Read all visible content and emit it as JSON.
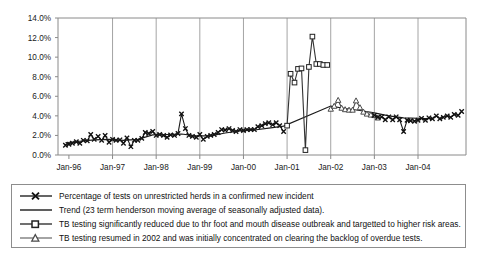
{
  "chart_data": {
    "type": "line",
    "title": "",
    "xlabel": "",
    "ylabel": "",
    "ylim": [
      0,
      14
    ],
    "ytick_labels": [
      "0.0%",
      "2.0%",
      "4.0%",
      "6.0%",
      "8.0%",
      "10.0%",
      "12.0%",
      "14.0%"
    ],
    "ytick_values": [
      0,
      2,
      4,
      6,
      8,
      10,
      12,
      14
    ],
    "xtick_labels": [
      "Jan-96",
      "Jan-97",
      "Jan-98",
      "Jan-99",
      "Jan-00",
      "Jan-01",
      "Jan-02",
      "Jan-03",
      "Jan-04"
    ],
    "xtick_values": [
      1996.0,
      1997.0,
      1998.0,
      1999.0,
      2000.0,
      2001.0,
      2002.0,
      2003.0,
      2004.0
    ],
    "xlim": [
      1995.75,
      2005.1
    ],
    "grid": "vertical only",
    "legend_position": "below-plot",
    "series": [
      {
        "name": "Percentage of tests on unrestricted herds in a confirmed new incident",
        "marker": "x",
        "x": [
          1995.92,
          1996.0,
          1996.08,
          1996.17,
          1996.25,
          1996.33,
          1996.42,
          1996.5,
          1996.58,
          1996.67,
          1996.75,
          1996.83,
          1996.92,
          1997.0,
          1997.08,
          1997.17,
          1997.25,
          1997.33,
          1997.42,
          1997.5,
          1997.58,
          1997.67,
          1997.75,
          1997.83,
          1997.92,
          1998.0,
          1998.08,
          1998.17,
          1998.25,
          1998.33,
          1998.42,
          1998.5,
          1998.58,
          1998.67,
          1998.75,
          1998.83,
          1998.92,
          1999.0,
          1999.08,
          1999.17,
          1999.25,
          1999.33,
          1999.42,
          1999.5,
          1999.58,
          1999.67,
          1999.75,
          1999.83,
          1999.92,
          2000.0,
          2000.08,
          2000.17,
          2000.25,
          2000.33,
          2000.42,
          2000.5,
          2000.58,
          2000.67,
          2000.75,
          2000.83,
          2000.92
        ],
        "values": [
          1.0,
          1.1,
          1.2,
          1.35,
          1.2,
          1.5,
          1.45,
          2.1,
          1.6,
          1.9,
          1.5,
          2.0,
          1.3,
          1.6,
          1.5,
          1.55,
          1.2,
          1.75,
          0.85,
          1.5,
          1.5,
          1.7,
          2.3,
          2.2,
          2.4,
          2.0,
          2.1,
          2.0,
          1.8,
          2.05,
          2.0,
          2.2,
          4.2,
          2.7,
          2.0,
          1.9,
          1.8,
          2.1,
          1.6,
          1.9,
          2.0,
          2.1,
          2.3,
          2.6,
          2.55,
          2.7,
          2.5,
          2.4,
          2.6,
          2.5,
          2.6,
          2.6,
          2.6,
          2.9,
          3.0,
          3.2,
          3.3,
          3.1,
          3.3,
          3.0,
          2.4
        ]
      },
      {
        "name": "Trend (23 term henderson moving average of seasonally adjusted data).",
        "marker": "none",
        "x": [
          1995.92,
          1996.25,
          1996.58,
          1996.92,
          1997.25,
          1997.58,
          1997.92,
          1998.25,
          1998.58,
          1998.92,
          1999.25,
          1999.58,
          1999.92,
          2000.25,
          2000.58,
          2000.92,
          2002.0,
          2002.33,
          2002.67,
          2003.0,
          2003.33,
          2003.67,
          2004.0,
          2004.33
        ],
        "values": [
          1.25,
          1.4,
          1.55,
          1.6,
          1.5,
          1.6,
          2.05,
          2.1,
          2.15,
          1.95,
          1.95,
          2.25,
          2.45,
          2.55,
          2.75,
          2.95,
          5.0,
          4.75,
          4.55,
          4.3,
          4.0,
          3.8,
          3.75,
          3.7
        ]
      },
      {
        "name": "TB testing significantly reduced due to thr foot and mouth disease outbreak and targetted to higher risk areas.",
        "marker": "square",
        "x": [
          2001.0,
          2001.08,
          2001.17,
          2001.25,
          2001.33,
          2001.42,
          2001.5,
          2001.58,
          2001.67,
          2001.75,
          2001.83,
          2001.92
        ],
        "values": [
          3.0,
          8.3,
          7.4,
          8.8,
          8.85,
          0.5,
          9.0,
          12.1,
          9.3,
          9.3,
          9.2,
          9.2
        ]
      },
      {
        "name": "TB testing resumed in 2002 and was initially concentrated on clearing the backlog of overdue tests.",
        "marker": "triangle",
        "x": [
          2002.0,
          2002.08,
          2002.17,
          2002.25,
          2002.33,
          2002.42,
          2002.5,
          2002.58,
          2002.67,
          2002.75,
          2002.83,
          2002.92,
          2003.0,
          2003.08
        ],
        "values": [
          4.7,
          5.0,
          5.6,
          4.8,
          4.65,
          4.6,
          4.6,
          5.55,
          4.85,
          4.4,
          4.2,
          4.1,
          4.05,
          3.8
        ]
      },
      {
        "name": "Percentage of tests on unrestricted herds in a confirmed new incident (post-2003)",
        "marker": "x",
        "x": [
          2003.0,
          2003.08,
          2003.17,
          2003.25,
          2003.33,
          2003.42,
          2003.5,
          2003.58,
          2003.67,
          2003.75,
          2003.83,
          2003.92,
          2004.0,
          2004.08,
          2004.17,
          2004.25,
          2004.33,
          2004.42,
          2004.5,
          2004.58,
          2004.67,
          2004.75,
          2004.83,
          2004.92,
          2005.0
        ],
        "values": [
          4.05,
          3.85,
          3.9,
          3.6,
          3.9,
          3.6,
          3.9,
          3.6,
          2.4,
          3.55,
          3.5,
          3.45,
          3.55,
          3.75,
          3.55,
          3.8,
          3.7,
          4.0,
          3.7,
          3.85,
          4.0,
          3.85,
          4.15,
          4.05,
          4.45
        ]
      }
    ]
  },
  "legend": {
    "items": [
      {
        "marker": "line-x-marker",
        "label": "Percentage of tests on unrestricted herds in a confirmed new incident"
      },
      {
        "marker": "line-plain",
        "label": "Trend (23 term henderson moving average of seasonally adjusted data)."
      },
      {
        "marker": "line-square-marker",
        "label": "TB testing significantly reduced due to thr foot and mouth disease outbreak and targetted to higher risk areas."
      },
      {
        "marker": "line-triangle-marker",
        "label": "TB testing resumed in 2002 and was initially concentrated on clearing the backlog of overdue tests."
      }
    ]
  },
  "colors": {
    "series_main": "#111111",
    "series_trend": "#1a1a1a",
    "series_square": "#333333",
    "series_triangle": "#4a4a4a",
    "axis": "#8a8a8a",
    "grid": "#9a9a9a",
    "background": "#ffffff"
  }
}
